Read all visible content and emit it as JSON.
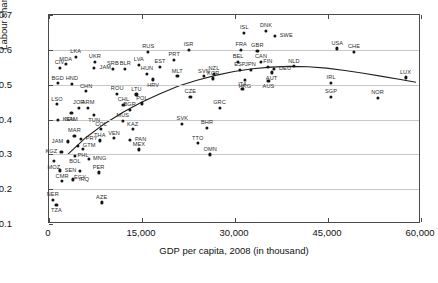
{
  "top_strip_text": "",
  "chart_data": {
    "type": "scatter",
    "title": "",
    "xlabel": "GDP per capita, 2008 (in thousand)",
    "ylabel": "Labour share of income",
    "xlim": [
      0,
      60000
    ],
    "ylim": [
      0.1,
      0.7
    ],
    "xticks": [
      0,
      15000,
      30000,
      45000,
      60000
    ],
    "xticklabels": [
      "0",
      "15,000",
      "30,000",
      "45,000",
      "60,000"
    ],
    "yticks": [
      0.1,
      0.2,
      0.3,
      0.4,
      0.5,
      0.6,
      0.7
    ],
    "yticklabels": [
      "0.1",
      "0.2",
      "0.3",
      "0.4",
      "0.5",
      "0.6",
      "0.7"
    ],
    "grid": "horizontal",
    "legend": "none",
    "fit_curve": {
      "name": "quadratic-fit",
      "points": [
        [
          3000,
          0.295
        ],
        [
          6000,
          0.345
        ],
        [
          9000,
          0.385
        ],
        [
          12000,
          0.418
        ],
        [
          15000,
          0.447
        ],
        [
          18000,
          0.472
        ],
        [
          21000,
          0.494
        ],
        [
          24000,
          0.511
        ],
        [
          27000,
          0.525
        ],
        [
          30000,
          0.536
        ],
        [
          33000,
          0.544
        ],
        [
          36000,
          0.549
        ],
        [
          39000,
          0.551
        ],
        [
          42000,
          0.55
        ],
        [
          45000,
          0.546
        ],
        [
          48000,
          0.539
        ],
        [
          51000,
          0.531
        ],
        [
          54000,
          0.522
        ],
        [
          57000,
          0.513
        ],
        [
          59500,
          0.505
        ]
      ]
    },
    "points": [
      {
        "label": "LKA",
        "x": 4300,
        "y": 0.58,
        "lp": "above"
      },
      {
        "label": "MDA",
        "x": 2700,
        "y": 0.559,
        "lp": "above"
      },
      {
        "label": "JAM",
        "x": 7300,
        "y": 0.548,
        "lp": "right"
      },
      {
        "label": "HND",
        "x": 3700,
        "y": 0.503,
        "lp": "above"
      },
      {
        "label": "UKR",
        "x": 7400,
        "y": 0.566,
        "lp": "above"
      },
      {
        "label": "CIV",
        "x": 1700,
        "y": 0.549,
        "lp": "above"
      },
      {
        "label": "SRB",
        "x": 10300,
        "y": 0.545,
        "lp": "above"
      },
      {
        "label": "BGD",
        "x": 1400,
        "y": 0.504,
        "lp": "above"
      },
      {
        "label": "CHN",
        "x": 6000,
        "y": 0.481,
        "lp": "above"
      },
      {
        "label": "BLR",
        "x": 12300,
        "y": 0.545,
        "lp": "above"
      },
      {
        "label": "LVA",
        "x": 14500,
        "y": 0.557,
        "lp": "above"
      },
      {
        "label": "EST",
        "x": 17900,
        "y": 0.552,
        "lp": "above"
      },
      {
        "label": "HUN",
        "x": 15800,
        "y": 0.532,
        "lp": "above"
      },
      {
        "label": "HRV",
        "x": 16800,
        "y": 0.515,
        "lp": "below"
      },
      {
        "label": "MLT",
        "x": 20700,
        "y": 0.524,
        "lp": "above"
      },
      {
        "label": "RUS",
        "x": 16000,
        "y": 0.594,
        "lp": "above"
      },
      {
        "label": "ISR",
        "x": 22500,
        "y": 0.6,
        "lp": "above"
      },
      {
        "label": "PRT",
        "x": 20200,
        "y": 0.572,
        "lp": "above"
      },
      {
        "label": "ROU",
        "x": 11000,
        "y": 0.474,
        "lp": "above"
      },
      {
        "label": "LTU",
        "x": 14100,
        "y": 0.472,
        "lp": "above"
      },
      {
        "label": "POL",
        "x": 15000,
        "y": 0.446,
        "lp": "above"
      },
      {
        "label": "CHL",
        "x": 12000,
        "y": 0.443,
        "lp": "above"
      },
      {
        "label": "BGR",
        "x": 13000,
        "y": 0.428,
        "lp": "above"
      },
      {
        "label": "CZE",
        "x": 22800,
        "y": 0.466,
        "lp": "above"
      },
      {
        "label": "SVN",
        "x": 25000,
        "y": 0.524,
        "lp": "above"
      },
      {
        "label": "NZL",
        "x": 26600,
        "y": 0.532,
        "lp": "above"
      },
      {
        "label": "KOR",
        "x": 26500,
        "y": 0.518,
        "lp": "above"
      },
      {
        "label": "ESP",
        "x": 30800,
        "y": 0.543,
        "lp": "above"
      },
      {
        "label": "JPN",
        "x": 32500,
        "y": 0.543,
        "lp": "above"
      },
      {
        "label": "BEL",
        "x": 30500,
        "y": 0.566,
        "lp": "above"
      },
      {
        "label": "CAN",
        "x": 34200,
        "y": 0.566,
        "lp": "above"
      },
      {
        "label": "FRA",
        "x": 31000,
        "y": 0.6,
        "lp": "above"
      },
      {
        "label": "GBR",
        "x": 33600,
        "y": 0.598,
        "lp": "above"
      },
      {
        "label": "ISL",
        "x": 31500,
        "y": 0.649,
        "lp": "above"
      },
      {
        "label": "DNK",
        "x": 35000,
        "y": 0.654,
        "lp": "above"
      },
      {
        "label": "SWE",
        "x": 36500,
        "y": 0.639,
        "lp": "right"
      },
      {
        "label": "FIN",
        "x": 35300,
        "y": 0.552,
        "lp": "above"
      },
      {
        "label": "DEU",
        "x": 36300,
        "y": 0.546,
        "lp": "right"
      },
      {
        "label": "AUT",
        "x": 35900,
        "y": 0.535,
        "lp": "below"
      },
      {
        "label": "NLD",
        "x": 39500,
        "y": 0.553,
        "lp": "above"
      },
      {
        "label": "AUS",
        "x": 35400,
        "y": 0.511,
        "lp": "below"
      },
      {
        "label": "HKG",
        "x": 31600,
        "y": 0.513,
        "lp": "below"
      },
      {
        "label": "ITA",
        "x": 31200,
        "y": 0.487,
        "lp": "above"
      },
      {
        "label": "USA",
        "x": 46500,
        "y": 0.604,
        "lp": "above"
      },
      {
        "label": "CHE",
        "x": 49200,
        "y": 0.595,
        "lp": "above"
      },
      {
        "label": "IRL",
        "x": 45500,
        "y": 0.505,
        "lp": "above"
      },
      {
        "label": "LUX",
        "x": 57500,
        "y": 0.521,
        "lp": "above"
      },
      {
        "label": "SGP",
        "x": 45500,
        "y": 0.466,
        "lp": "above"
      },
      {
        "label": "NOR",
        "x": 53000,
        "y": 0.462,
        "lp": "above"
      },
      {
        "label": "GRC",
        "x": 27500,
        "y": 0.434,
        "lp": "above"
      },
      {
        "label": "SVK",
        "x": 21500,
        "y": 0.388,
        "lp": "above"
      },
      {
        "label": "BHR",
        "x": 25500,
        "y": 0.377,
        "lp": "above"
      },
      {
        "label": "TTO",
        "x": 24000,
        "y": 0.332,
        "lp": "above"
      },
      {
        "label": "OMN",
        "x": 26000,
        "y": 0.3,
        "lp": "above"
      },
      {
        "label": "LSO",
        "x": 1300,
        "y": 0.444,
        "lp": "above"
      },
      {
        "label": "JOR",
        "x": 4800,
        "y": 0.434,
        "lp": "above"
      },
      {
        "label": "ARM",
        "x": 6300,
        "y": 0.434,
        "lp": "above"
      },
      {
        "label": "NAM",
        "x": 3600,
        "y": 0.418,
        "lp": "below"
      },
      {
        "label": "TUN",
        "x": 7300,
        "y": 0.414,
        "lp": "below"
      },
      {
        "label": "KEN",
        "x": 1400,
        "y": 0.4,
        "lp": "right"
      },
      {
        "label": "MUS",
        "x": 11900,
        "y": 0.396,
        "lp": "above"
      },
      {
        "label": "COL",
        "x": 8400,
        "y": 0.372,
        "lp": "above"
      },
      {
        "label": "KAZ",
        "x": 13500,
        "y": 0.372,
        "lp": "above"
      },
      {
        "label": "MAR",
        "x": 4100,
        "y": 0.354,
        "lp": "above"
      },
      {
        "label": "PRY",
        "x": 5100,
        "y": 0.344,
        "lp": "right"
      },
      {
        "label": "THA",
        "x": 8200,
        "y": 0.34,
        "lp": "above"
      },
      {
        "label": "VEN",
        "x": 10500,
        "y": 0.346,
        "lp": "above"
      },
      {
        "label": "PAN",
        "x": 13000,
        "y": 0.341,
        "lp": "right"
      },
      {
        "label": "JAM2",
        "x": 3000,
        "y": 0.337,
        "lp": "left"
      },
      {
        "label": "GTM",
        "x": 4700,
        "y": 0.325,
        "lp": "right"
      },
      {
        "label": "PHL",
        "x": 5500,
        "y": 0.315,
        "lp": "below"
      },
      {
        "label": "KGZ",
        "x": 2000,
        "y": 0.308,
        "lp": "left"
      },
      {
        "label": "BOL",
        "x": 4200,
        "y": 0.296,
        "lp": "below"
      },
      {
        "label": "MEX",
        "x": 14500,
        "y": 0.314,
        "lp": "above"
      },
      {
        "label": "MNG",
        "x": 6400,
        "y": 0.288,
        "lp": "right"
      },
      {
        "label": "MOZ",
        "x": 800,
        "y": 0.281,
        "lp": "below"
      },
      {
        "label": "SEN",
        "x": 1700,
        "y": 0.254,
        "lp": "right"
      },
      {
        "label": "EGY",
        "x": 5000,
        "y": 0.252,
        "lp": "below"
      },
      {
        "label": "PER",
        "x": 8000,
        "y": 0.248,
        "lp": "above"
      },
      {
        "label": "CMR",
        "x": 2100,
        "y": 0.223,
        "lp": "above"
      },
      {
        "label": "IRQ",
        "x": 3900,
        "y": 0.228,
        "lp": "right"
      },
      {
        "label": "NER",
        "x": 600,
        "y": 0.17,
        "lp": "above"
      },
      {
        "label": "TZA",
        "x": 1200,
        "y": 0.155,
        "lp": "below"
      },
      {
        "label": "AZE",
        "x": 8500,
        "y": 0.162,
        "lp": "above"
      }
    ]
  }
}
